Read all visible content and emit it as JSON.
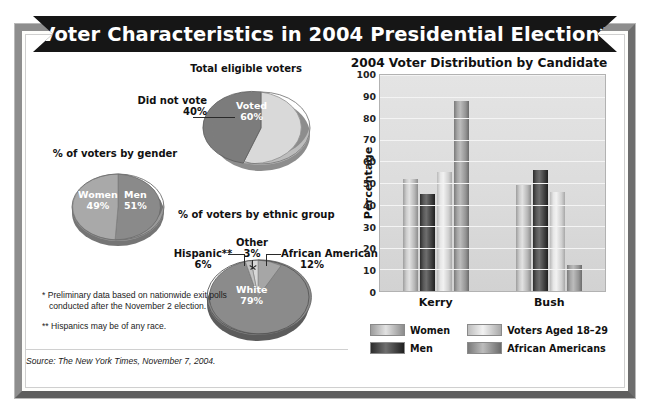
{
  "title": "Voter Characteristics in 2004 Presidential Election*",
  "pies": {
    "turnout": {
      "heading": "Total eligible voters",
      "slices": [
        {
          "label": "Voted",
          "value": "60%",
          "pct": 60
        },
        {
          "label": "Did not vote",
          "value": "40%",
          "pct": 40
        }
      ]
    },
    "gender": {
      "heading": "% of voters by gender",
      "slices": [
        {
          "label": "Women",
          "value": "49%",
          "pct": 49
        },
        {
          "label": "Men",
          "value": "51%",
          "pct": 51
        }
      ]
    },
    "ethnic": {
      "heading": "% of voters by ethnic group",
      "slices": [
        {
          "label": "White",
          "value": "79%",
          "pct": 79
        },
        {
          "label": "African American",
          "value": "12%",
          "pct": 12
        },
        {
          "label": "Other",
          "value": "3%",
          "pct": 3
        },
        {
          "label": "Hispanic**",
          "value": "6%",
          "pct": 6
        }
      ]
    }
  },
  "chart_data": {
    "type": "bar",
    "title": "2004 Voter Distribution by Candidate",
    "xlabel": "",
    "ylabel": "Percentage",
    "ylim": [
      0,
      100
    ],
    "yticks": [
      100,
      90,
      80,
      70,
      60,
      50,
      40,
      30,
      20,
      10,
      0
    ],
    "grid": true,
    "legend_position": "bottom",
    "categories": [
      "Kerry",
      "Bush"
    ],
    "series": [
      {
        "name": "Women",
        "values": [
          52,
          49
        ]
      },
      {
        "name": "Men",
        "values": [
          45,
          56
        ]
      },
      {
        "name": "Voters Aged 18–29",
        "values": [
          55,
          46
        ]
      },
      {
        "name": "African Americans",
        "values": [
          88,
          12
        ]
      }
    ]
  },
  "notes": {
    "footnote1": "* Preliminary data based on nationwide exit polls conducted after the November 2 election.",
    "footnote2": "** Hispanics may be of any race.",
    "source": "Source: The New York Times, November 7, 2004."
  }
}
